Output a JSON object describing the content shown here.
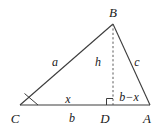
{
  "figure": {
    "type": "geometry-diagram",
    "background_color": "#ffffff",
    "stroke_color": "#3c3c3c",
    "text_color": "#1a1a1a",
    "width": 163,
    "height": 129
  },
  "vertices": {
    "B": {
      "label": "B",
      "x": 113,
      "y": 24,
      "label_x": 113,
      "label_y": 12
    },
    "C": {
      "label": "C",
      "x": 20,
      "y": 105,
      "label_x": 15,
      "label_y": 118
    },
    "A": {
      "label": "A",
      "x": 150,
      "y": 105,
      "label_x": 147,
      "label_y": 118
    },
    "D": {
      "label": "D",
      "x": 113,
      "y": 105,
      "label_x": 105,
      "label_y": 118
    }
  },
  "segments": [
    {
      "name": "side-a",
      "from": "C",
      "to": "B",
      "style": "solid",
      "label": "a",
      "label_x": 55,
      "label_y": 62
    },
    {
      "name": "side-c",
      "from": "B",
      "to": "A",
      "style": "solid",
      "label": "c",
      "label_x": 137,
      "label_y": 62
    },
    {
      "name": "base-b",
      "from": "C",
      "to": "A",
      "style": "solid",
      "label": "b",
      "label_x": 72,
      "label_y": 118
    },
    {
      "name": "altitude-h",
      "from": "B",
      "to": "D",
      "style": "dashed",
      "label": "h",
      "label_x": 98,
      "label_y": 62
    }
  ],
  "measures": [
    {
      "name": "segment-x",
      "label": "x",
      "label_x": 68,
      "label_y": 99
    },
    {
      "name": "segment-b-minus-x",
      "label": "b−x",
      "label_x": 129,
      "label_y": 97
    }
  ],
  "markers": {
    "angle_at_C": {
      "name": "angle-marker-c",
      "type": "angle-wedge"
    },
    "right_angle_at_D": {
      "name": "right-angle-marker-d",
      "type": "square"
    }
  }
}
